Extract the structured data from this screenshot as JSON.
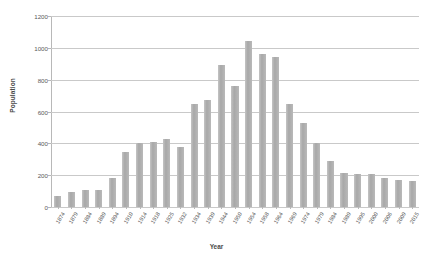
{
  "chart_data": {
    "type": "bar",
    "title": "",
    "xlabel": "Year",
    "ylabel": "Population",
    "ylim": [
      0,
      1200
    ],
    "yticks": [
      0,
      200,
      400,
      600,
      800,
      1000,
      1200
    ],
    "grid": true,
    "legend": false,
    "bar_color": "#b0b0b0",
    "categories": [
      "1874",
      "1879",
      "1884",
      "1889",
      "1894",
      "1910",
      "1914",
      "1918",
      "1925",
      "1932",
      "1934",
      "1939",
      "1944",
      "1950",
      "1954",
      "1958",
      "1964",
      "1969",
      "1974",
      "1979",
      "1984",
      "1989",
      "1995",
      "2000",
      "2006",
      "2009",
      "2015"
    ],
    "values": [
      70,
      95,
      110,
      110,
      185,
      345,
      400,
      410,
      430,
      380,
      650,
      670,
      895,
      760,
      1040,
      960,
      945,
      650,
      530,
      405,
      290,
      215,
      210,
      205,
      180,
      170,
      165
    ]
  }
}
